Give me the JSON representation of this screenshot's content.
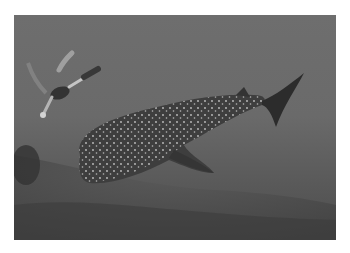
{
  "image": {
    "alt": "Grayscale underwater photograph of a whale shark swimming over a seabed with a scuba diver nearby",
    "subjects": [
      "whale shark",
      "scuba diver",
      "seabed"
    ],
    "colors": {
      "background": "#ffffff",
      "water": "#6a6a6a",
      "seabed": "#4c4c4c",
      "shark_body": "#3e3e3e",
      "spots": "#d8d8d8"
    }
  }
}
